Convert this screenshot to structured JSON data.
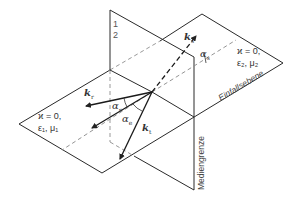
{
  "diagram": {
    "planes": {
      "incidence_plane_label": "Einfallsebene",
      "boundary_plane_label": "Mediengrenze"
    },
    "media": {
      "medium1": {
        "line1": "ϰ = 0,",
        "line2": "ε₁, μ₁"
      },
      "medium2": {
        "line1": "ϰ = 0,",
        "line2": "ε₂, μ₂"
      }
    },
    "side_numbers": {
      "top": "1",
      "bottom": "2"
    },
    "vectors": {
      "incident": {
        "symbol": "k",
        "subscript": "r"
      },
      "transmitted": {
        "symbol": "k",
        "subscript": "t"
      },
      "reflected_out": {
        "symbol": "k",
        "subscript": "s"
      }
    },
    "angles": {
      "alpha_r": {
        "symbol": "α",
        "subscript": "r"
      },
      "alpha_e": {
        "symbol": "α",
        "subscript": "e"
      },
      "alpha_t": {
        "symbol": "α",
        "subscript": "t"
      }
    },
    "colors": {
      "line": "#2a2a2a",
      "dashed": "#888888"
    }
  }
}
